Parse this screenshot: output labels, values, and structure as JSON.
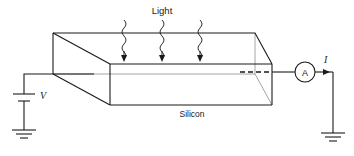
{
  "figure": {
    "labels": {
      "light": "Light",
      "material": "Silicon",
      "voltage": "V",
      "current": "I",
      "ammeter": "A"
    },
    "colors": {
      "line": "#1a1a1a",
      "hidden_line": "#8d8d8d",
      "background": "#ffffff"
    },
    "components": {
      "battery_name": "battery",
      "ammeter_name": "ammeter",
      "ground_left_name": "ground",
      "ground_right_name": "ground",
      "slab_name": "silicon-slab"
    },
    "light_rays": [
      {
        "id": "ray-1"
      },
      {
        "id": "ray-2"
      },
      {
        "id": "ray-3"
      }
    ]
  }
}
